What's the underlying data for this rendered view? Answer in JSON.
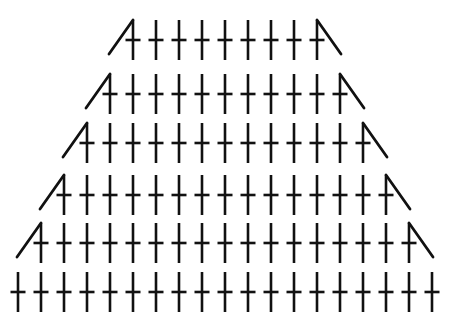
{
  "figure": {
    "glyph_name": "cross-dagger-glyph",
    "shape": "trapezoid",
    "background_color": "#ffffff",
    "ink_color": "#111111",
    "canvas": {
      "width": 450,
      "height": 335
    },
    "row_count": 6,
    "column_spacing": 23,
    "center_x": 225,
    "glyph": {
      "stem_top_offset": -20,
      "stem_bottom_offset": 20,
      "bar_half_width": 7.5,
      "bar_offset_y": 0,
      "stroke_width": 2.6
    },
    "rows": [
      {
        "index": 1,
        "count": 9,
        "y": 40,
        "left_edge": true,
        "right_edge": true
      },
      {
        "index": 2,
        "count": 11,
        "y": 94,
        "left_edge": true,
        "right_edge": true
      },
      {
        "index": 3,
        "count": 13,
        "y": 143,
        "left_edge": true,
        "right_edge": true
      },
      {
        "index": 4,
        "count": 15,
        "y": 195,
        "left_edge": true,
        "right_edge": true
      },
      {
        "index": 5,
        "count": 17,
        "y": 243,
        "left_edge": true,
        "right_edge": true
      },
      {
        "index": 6,
        "count": 19,
        "y": 292,
        "left_edge": false,
        "right_edge": false
      }
    ],
    "edge": {
      "dx": 24,
      "dy": 34,
      "description": "diagonal stroke slanting down-and-outward from each row end"
    }
  }
}
